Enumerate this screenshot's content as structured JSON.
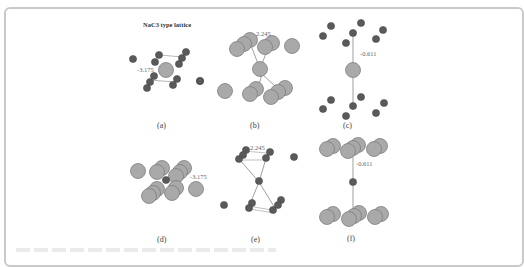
{
  "figure": {
    "title": "NaC3 type lattice",
    "panels": [
      {
        "id": "a",
        "label": "(a)",
        "value": "-3.175"
      },
      {
        "id": "b",
        "label": "(b)",
        "value": "2.245"
      },
      {
        "id": "c",
        "label": "(c)",
        "value": "-0.611"
      },
      {
        "id": "d",
        "label": "(d)",
        "value": "-3.175"
      },
      {
        "id": "e",
        "label": "(e)",
        "value": "2.245"
      },
      {
        "id": "f",
        "label": "(f)",
        "value": "-0.611"
      }
    ],
    "colors": {
      "large_atom": "#a9a9a9",
      "small_atom": "#5a5a5a",
      "bond": "#777777",
      "border": "#c9c9c9"
    }
  }
}
